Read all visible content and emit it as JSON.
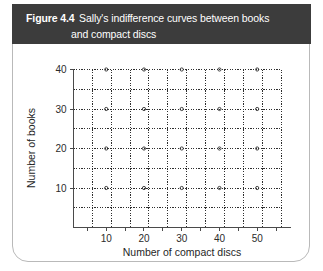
{
  "figure": {
    "number": "Figure 4.4",
    "caption_line_1": "Sally's indifference curves between books",
    "caption_line_2": "and compact discs",
    "header_color": "#3c3c3c",
    "border_color": "#b9b9b9"
  },
  "chart_data": {
    "type": "scatter",
    "title": "Sally's indifference curves between books and compact discs",
    "xlabel": "Number of compact discs",
    "ylabel": "Number of books",
    "xlim": [
      0,
      57.5
    ],
    "ylim": [
      0,
      40
    ],
    "x_ticks": [
      10,
      20,
      30,
      40,
      50
    ],
    "y_ticks": [
      10,
      20,
      30,
      40
    ],
    "x_tick_labels": [
      "10",
      "20",
      "30",
      "40",
      "50"
    ],
    "y_tick_labels": [
      "10",
      "20",
      "30",
      "40"
    ],
    "x_gridlines": [
      5,
      10,
      15,
      20,
      25,
      30,
      35,
      40,
      45,
      50,
      55
    ],
    "y_gridlines": [
      5,
      10,
      15,
      20,
      25,
      30,
      35,
      40
    ],
    "grid": "dotted",
    "grid_color": "#2e2e2e",
    "legend": "none",
    "series": [],
    "annotations": [],
    "note": "Empty grid — no indifference curves plotted"
  },
  "axis_titles": {
    "x": "Number of compact discs",
    "y": "Number of books"
  }
}
